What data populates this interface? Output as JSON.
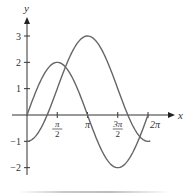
{
  "chart_data": {
    "type": "line",
    "title": "",
    "xlabel": "x",
    "ylabel": "y",
    "xlim": [
      0,
      6.6
    ],
    "ylim": [
      -2.5,
      3.7
    ],
    "grid": false,
    "legend": "none",
    "x_ticks": [
      {
        "value": 1.5708,
        "label_num": "π",
        "label_den": "2",
        "fraction": true
      },
      {
        "value": 3.1416,
        "label": "π",
        "fraction": false
      },
      {
        "value": 4.7124,
        "label_num": "3π",
        "label_den": "2",
        "fraction": true
      },
      {
        "value": 6.2832,
        "label": "2π",
        "fraction": false
      }
    ],
    "y_ticks": [
      {
        "value": 3,
        "label": "3"
      },
      {
        "value": 2,
        "label": "2"
      },
      {
        "value": 1,
        "label": "1"
      },
      {
        "value": -1,
        "label": "−1"
      },
      {
        "value": -2,
        "label": "−2"
      }
    ],
    "series": [
      {
        "name": "2 sin x",
        "x_range": [
          0,
          6.2832
        ],
        "points": [
          [
            0,
            0
          ],
          [
            0.7854,
            1.414
          ],
          [
            1.5708,
            2
          ],
          [
            2.3562,
            1.414
          ],
          [
            3.1416,
            0
          ],
          [
            3.927,
            -1.414
          ],
          [
            4.7124,
            -2
          ],
          [
            5.4978,
            -1.414
          ],
          [
            6.2832,
            0
          ]
        ]
      },
      {
        "name": "1 − 2 cos x",
        "x_range": [
          0,
          6.4
        ],
        "points": [
          [
            0,
            -1
          ],
          [
            1.0472,
            0
          ],
          [
            1.5708,
            1
          ],
          [
            2.0944,
            2
          ],
          [
            3.1416,
            3
          ],
          [
            4.1888,
            2
          ],
          [
            4.7124,
            1
          ],
          [
            5.236,
            0
          ],
          [
            6.2832,
            -1
          ]
        ]
      }
    ]
  }
}
